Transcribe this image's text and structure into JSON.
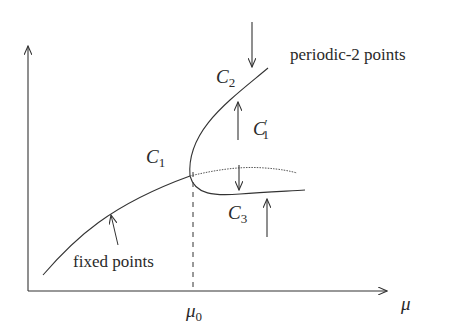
{
  "diagram": {
    "type": "bifurcation-diagram",
    "axes": {
      "x_label": "μ",
      "y_label": "",
      "x_tick_label": "μ",
      "x_tick_sub": "0"
    },
    "curves": [
      {
        "id": "fixed-points",
        "label": "fixed points",
        "style": "solid"
      },
      {
        "id": "C2",
        "label": "C",
        "sub": "2",
        "style": "solid",
        "stability": "stable"
      },
      {
        "id": "C3",
        "label": "C",
        "sub": "3",
        "style": "solid",
        "stability": "stable"
      },
      {
        "id": "C1-prime",
        "label": "C",
        "sub": "1",
        "prime": "′",
        "style": "dotted",
        "stability": "unstable"
      }
    ],
    "labels": {
      "bifurcation_point": {
        "main": "C",
        "sub": "1"
      },
      "c2": {
        "main": "C",
        "sub": "2"
      },
      "c3": {
        "main": "C",
        "sub": "3"
      },
      "c1_prime": {
        "main": "C",
        "sub": "1",
        "prime": "′"
      },
      "periodic_2": "periodic-2 points",
      "fixed_points": "fixed points",
      "mu_axis": "μ",
      "mu0": {
        "main": "μ",
        "sub": "0"
      }
    },
    "colors": {
      "line": "#333333",
      "text": "#2a2a2a",
      "background": "#ffffff"
    }
  }
}
